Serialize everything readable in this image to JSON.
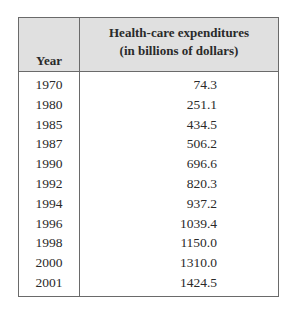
{
  "table": {
    "headers": {
      "year": "Year",
      "expenditures_line1": "Health-care expenditures",
      "expenditures_line2": "(in billions of dollars)"
    },
    "rows": [
      {
        "year": "1970",
        "value": "74.3"
      },
      {
        "year": "1980",
        "value": "251.1"
      },
      {
        "year": "1985",
        "value": "434.5"
      },
      {
        "year": "1987",
        "value": "506.2"
      },
      {
        "year": "1990",
        "value": "696.6"
      },
      {
        "year": "1992",
        "value": "820.3"
      },
      {
        "year": "1994",
        "value": "937.2"
      },
      {
        "year": "1996",
        "value": "1039.4"
      },
      {
        "year": "1998",
        "value": "1150.0"
      },
      {
        "year": "2000",
        "value": "1310.0"
      },
      {
        "year": "2001",
        "value": "1424.5"
      }
    ]
  },
  "colors": {
    "header_background": "#e0e0e0",
    "border": "#6a6a6a",
    "text": "#2a2a2a"
  }
}
